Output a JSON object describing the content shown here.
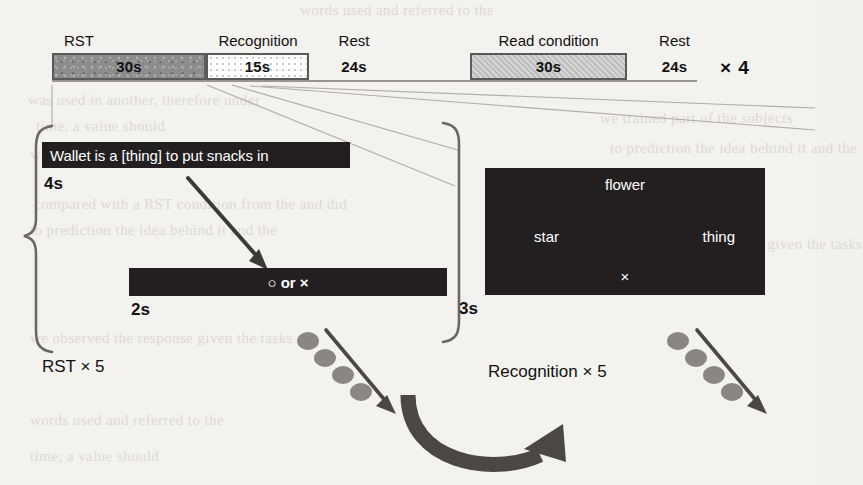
{
  "figure": {
    "background_color": "#f4f2ef",
    "ink_color": "#231f20"
  },
  "timeline": {
    "repeat_label": "× 4",
    "blocks": [
      {
        "name": "rst",
        "label": "RST",
        "duration": "30s",
        "fill": "#8c8c8c",
        "texture": "speckle",
        "bordered": true
      },
      {
        "name": "recognition",
        "label": "Recognition",
        "duration": "15s",
        "fill": "#fdfdfd",
        "texture": "dots",
        "bordered": true
      },
      {
        "name": "rest1",
        "label": "Rest",
        "duration": "24s",
        "fill": "none",
        "texture": "none",
        "bordered": false
      },
      {
        "name": "read",
        "label": "Read condition",
        "duration": "30s",
        "fill": "#c7c7c7",
        "texture": "hatch",
        "bordered": true
      },
      {
        "name": "rest2",
        "label": "Rest",
        "duration": "24s",
        "fill": "none",
        "texture": "none",
        "bordered": false
      }
    ]
  },
  "rst_panel": {
    "sentence": "Wallet is a [thing] to put snacks in",
    "sentence_duration": "4s",
    "response_prompt": "○ or ×",
    "response_duration": "2s",
    "cycle_label": "RST × 5"
  },
  "recognition_panel": {
    "words": {
      "top": "flower",
      "left": "star",
      "right": "thing"
    },
    "fixation": "×",
    "duration": "3s",
    "cycle_label": "Recognition × 5"
  },
  "bleed_text": {
    "lines": [
      "words used and referred to the",
      "was used in another, therefore under",
      "time; a value should",
      "we trained part of the subjects",
      "compared with a RST condition from the and did",
      "to prediction the idea behind it and the",
      "we observed the response given the tasks"
    ]
  }
}
